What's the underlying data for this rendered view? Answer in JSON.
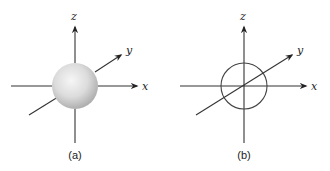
{
  "figure": {
    "panels": [
      {
        "id": "a",
        "caption": "(a)",
        "style": "shaded-sphere",
        "axes": {
          "x": "x",
          "y": "y",
          "z": "z"
        },
        "sphere_fill_light": "#f4f4f4",
        "sphere_fill_dark": "#b8b8b8"
      },
      {
        "id": "b",
        "caption": "(b)",
        "style": "circle-outline",
        "axes": {
          "x": "x",
          "y": "y",
          "z": "z"
        }
      }
    ],
    "colors": {
      "line": "#333333",
      "background": "#ffffff"
    }
  }
}
